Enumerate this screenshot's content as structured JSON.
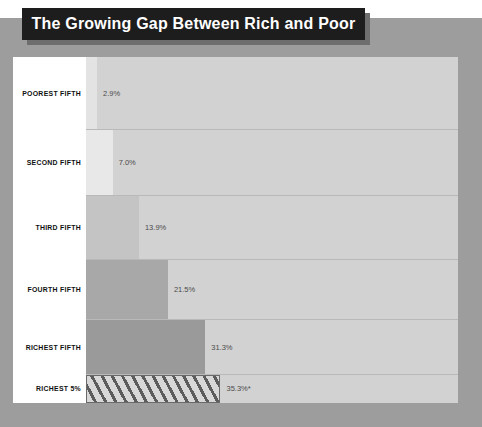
{
  "title": "The Growing Gap Between Rich and Poor",
  "colors": {
    "page_background": "#9d9d9d",
    "banner_background": "#1d1d1d",
    "banner_text": "#ffffff",
    "plot_background": "#d2d2d2",
    "label_panel": "#ffffff",
    "label_text": "#111111",
    "value_text": "#4b4b4b",
    "row_divider": "#b9b9b9"
  },
  "chart_data": {
    "type": "bar",
    "orientation": "horizontal",
    "title": "The Growing Gap Between Rich and Poor",
    "xlabel": "",
    "ylabel": "",
    "xlim": [
      0,
      98
    ],
    "grid": false,
    "legend": null,
    "categories": [
      "POOREST FIFTH",
      "SECOND FIFTH",
      "THIRD FIFTH",
      "FOURTH FIFTH",
      "RICHEST FIFTH",
      "RICHEST 5%"
    ],
    "values": [
      2.9,
      7.0,
      13.9,
      21.5,
      31.3,
      35.3
    ],
    "value_labels": [
      "2.9%",
      "7.0%",
      "13.9%",
      "21.5%",
      "31.3%",
      "35.3%*"
    ],
    "bar_colors": [
      "#e3e3e3",
      "#e8e8e8",
      "#c4c4c4",
      "#a8a8a8",
      "#9a9a9a",
      "#d8d8d8"
    ],
    "bar_patterns": [
      "solid",
      "solid",
      "solid",
      "solid",
      "solid",
      "diagonal-hatch"
    ],
    "annotations": [
      "* footnote marker on RICHEST 5% value"
    ]
  },
  "rows": [
    {
      "label": "POOREST FIFTH",
      "value": 2.9,
      "value_label": "2.9%",
      "bar_color": "#e3e3e3",
      "pattern": "solid",
      "top": 0,
      "height": 73
    },
    {
      "label": "SECOND FIFTH",
      "value": 7.0,
      "value_label": "7.0%",
      "bar_color": "#e8e8e8",
      "pattern": "solid",
      "top": 73,
      "height": 66
    },
    {
      "label": "THIRD FIFTH",
      "value": 13.9,
      "value_label": "13.9%",
      "bar_color": "#c4c4c4",
      "pattern": "solid",
      "top": 139,
      "height": 64
    },
    {
      "label": "FOURTH FIFTH",
      "value": 21.5,
      "value_label": "21.5%",
      "bar_color": "#a8a8a8",
      "pattern": "solid",
      "top": 203,
      "height": 60
    },
    {
      "label": "RICHEST FIFTH",
      "value": 31.3,
      "value_label": "31.3%",
      "bar_color": "#9a9a9a",
      "pattern": "solid",
      "top": 263,
      "height": 55
    },
    {
      "label": "RICHEST 5%",
      "value": 35.3,
      "value_label": "35.3%*",
      "bar_color": "#d8d8d8",
      "pattern": "diagonal-hatch",
      "top": 318,
      "height": 28
    }
  ],
  "scale": {
    "px_per_percent": 3.81,
    "bar_origin_x": 73
  }
}
